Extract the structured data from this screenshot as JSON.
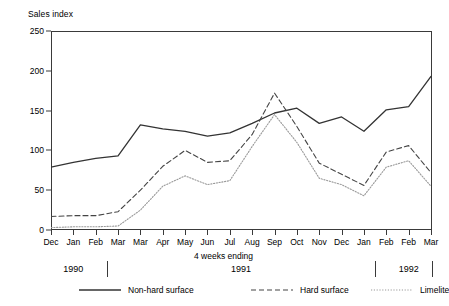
{
  "chart_data": {
    "type": "line",
    "title": "",
    "ylabel": "Sales index",
    "xlabel": "4 weeks ending",
    "ylim": [
      0,
      250
    ],
    "yticks": [
      0,
      50,
      100,
      150,
      200,
      250
    ],
    "grid": false,
    "legend_position": "bottom",
    "categories": [
      "Dec",
      "Jan",
      "Feb",
      "Mar",
      "Mar",
      "Apr",
      "May",
      "Jun",
      "Jul",
      "Aug",
      "Sep",
      "Oct",
      "Nov",
      "Dec",
      "Jan",
      "Feb",
      "Feb",
      "Mar"
    ],
    "year_bands": [
      {
        "label": "1990",
        "start_index": 0,
        "end_index": 2
      },
      {
        "label": "1991",
        "start_index": 3,
        "end_index": 14
      },
      {
        "label": "1992",
        "start_index": 15,
        "end_index": 17
      }
    ],
    "series": [
      {
        "name": "Non-hard surface",
        "style": "solid",
        "color": "#333333",
        "values": [
          79,
          85,
          90,
          93,
          132,
          127,
          124,
          118,
          122,
          134,
          147,
          153,
          134,
          142,
          124,
          151,
          155,
          193
        ]
      },
      {
        "name": "Hard surface",
        "style": "dashed",
        "color": "#444444",
        "values": [
          17,
          18,
          18,
          23,
          50,
          80,
          100,
          85,
          87,
          120,
          172,
          130,
          84,
          70,
          56,
          98,
          106,
          72
        ]
      },
      {
        "name": "Limelite",
        "style": "dotted",
        "color": "#9a9a9a",
        "values": [
          3,
          4,
          4,
          5,
          25,
          55,
          68,
          57,
          62,
          105,
          145,
          110,
          65,
          57,
          43,
          79,
          87,
          55
        ]
      }
    ]
  }
}
